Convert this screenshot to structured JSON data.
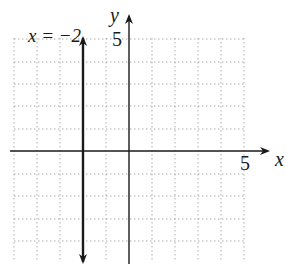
{
  "graph": {
    "x_axis_label": "x",
    "y_axis_label": "y",
    "x_tick_label": "5",
    "y_tick_label": "5",
    "line_label": "x = −2",
    "line_equation": "x = -2",
    "grid": {
      "x_min": -5,
      "x_max": 5,
      "y_min": -5,
      "y_max": 5,
      "step": 1
    }
  }
}
